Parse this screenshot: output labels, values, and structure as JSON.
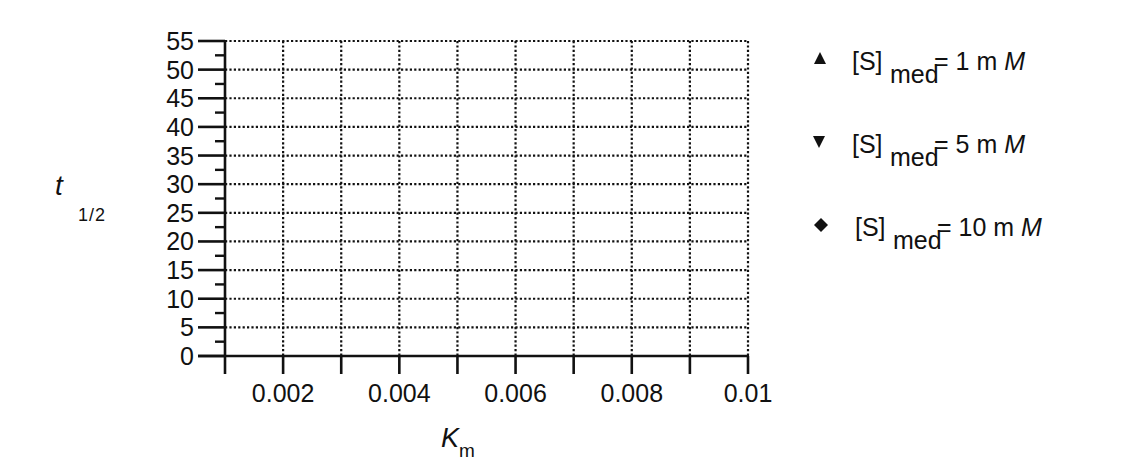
{
  "chart_data": {
    "type": "scatter",
    "title": "",
    "xlabel": "K_m",
    "xlabel_main": "K",
    "xlabel_sub": "m",
    "ylabel": "t_1/2",
    "ylabel_main": "t",
    "ylabel_sub": "1/2",
    "xlim": [
      0.001,
      0.01
    ],
    "ylim": [
      0,
      55
    ],
    "x_ticks": [
      0.001,
      0.002,
      0.003,
      0.004,
      0.005,
      0.006,
      0.007,
      0.008,
      0.009,
      0.01
    ],
    "x_tick_labels": [
      {
        "value": 0.002,
        "label": "0.002"
      },
      {
        "value": 0.004,
        "label": "0.004"
      },
      {
        "value": 0.006,
        "label": "0.006"
      },
      {
        "value": 0.008,
        "label": "0.008"
      },
      {
        "value": 0.01,
        "label": "0.01"
      }
    ],
    "y_ticks": [
      0,
      5,
      10,
      15,
      20,
      25,
      30,
      35,
      40,
      45,
      50,
      55
    ],
    "y_tick_labels": [
      "0",
      "5",
      "10",
      "15",
      "20",
      "25",
      "30",
      "35",
      "40",
      "45",
      "50",
      "55"
    ],
    "y_minor_step": 2.5,
    "grid": true,
    "grid_style": "dotted",
    "legend_position": "right",
    "series": [
      {
        "name": "[S]med = 1 mM",
        "marker": "triangle-up",
        "label_main": "[S]",
        "label_sub": "med",
        "label_eq": "= 1 m",
        "label_unit": "M",
        "values": []
      },
      {
        "name": "[S]med = 5 mM",
        "marker": "triangle-down",
        "label_main": "[S]",
        "label_sub": "med",
        "label_eq": "= 5 m",
        "label_unit": "M",
        "values": []
      },
      {
        "name": "[S]med = 10 mM",
        "marker": "diamond",
        "label_main": "[S]",
        "label_sub": "med",
        "label_eq": "= 10 m",
        "label_unit": "M",
        "values": []
      }
    ],
    "colors": {
      "axis": "#111111",
      "grid": "#111111",
      "background": "#ffffff"
    }
  }
}
